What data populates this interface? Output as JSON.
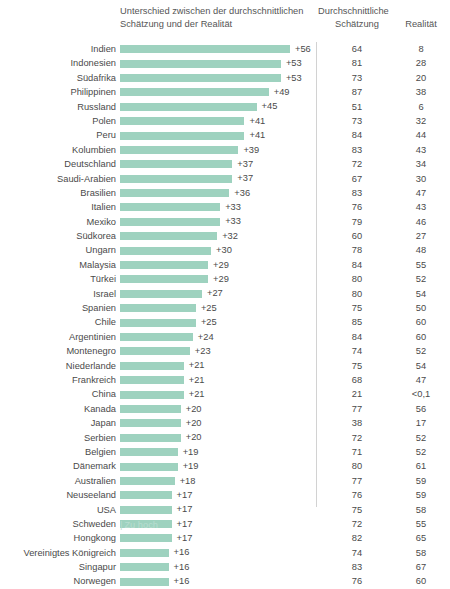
{
  "header": {
    "diff_title_line1": "Unterschied zwischen der durchschnittlichen",
    "diff_title_line2": "Schätzung und der Realität",
    "est_title_line1": "Durchschnittliche",
    "est_title_line2": "Schätzung",
    "real_title": "Realität"
  },
  "legend": {
    "tick": "|",
    "label": "Zu hoch"
  },
  "colors": {
    "bar": "#9ed2bf",
    "legend_text": "#b8ddd0",
    "divider": "#d2d2d2",
    "text": "#4a4a4a"
  },
  "chart_data": {
    "type": "bar",
    "title": "Unterschied zwischen der durchschnittlichen Schätzung und der Realität",
    "xlabel": "",
    "ylabel": "",
    "grid": false,
    "legend_position": "bottom-left",
    "xlim": [
      0,
      56
    ],
    "categories": [
      "Indien",
      "Indonesien",
      "Südafrika",
      "Philippinen",
      "Russland",
      "Polen",
      "Peru",
      "Kolumbien",
      "Deutschland",
      "Saudi-Arabien",
      "Brasilien",
      "Italien",
      "Mexiko",
      "Südkorea",
      "Ungarn",
      "Malaysia",
      "Türkei",
      "Israel",
      "Spanien",
      "Chile",
      "Argentinien",
      "Montenegro",
      "Niederlande",
      "Frankreich",
      "China",
      "Kanada",
      "Japan",
      "Serbien",
      "Belgien",
      "Dänemark",
      "Australien",
      "Neuseeland",
      "USA",
      "Schweden",
      "Hongkong",
      "Vereinigtes Königreich",
      "Singapur",
      "Norwegen"
    ],
    "values": [
      56,
      53,
      53,
      49,
      45,
      41,
      41,
      39,
      37,
      37,
      36,
      33,
      33,
      32,
      30,
      29,
      29,
      27,
      25,
      25,
      24,
      23,
      21,
      21,
      21,
      20,
      20,
      20,
      19,
      19,
      18,
      17,
      17,
      17,
      17,
      16,
      16,
      16
    ],
    "value_labels": [
      "+56",
      "+53",
      "+53",
      "+49",
      "+45",
      "+41",
      "+41",
      "+39",
      "+37",
      "+37",
      "+36",
      "+33",
      "+33",
      "+32",
      "+30",
      "+29",
      "+29",
      "+27",
      "+25",
      "+25",
      "+24",
      "+23",
      "+21",
      "+21",
      "+21",
      "+20",
      "+20",
      "+20",
      "+19",
      "+19",
      "+18",
      "+17",
      "+17",
      "+17",
      "+17",
      "+16",
      "+16",
      "+16"
    ],
    "series": [
      {
        "name": "Durchschnittliche Schätzung",
        "values": [
          64,
          81,
          73,
          87,
          51,
          73,
          84,
          83,
          72,
          67,
          83,
          76,
          79,
          60,
          78,
          84,
          80,
          80,
          75,
          85,
          84,
          74,
          75,
          68,
          21,
          77,
          38,
          72,
          71,
          80,
          77,
          76,
          75,
          72,
          82,
          74,
          83,
          76
        ],
        "display": [
          "64",
          "81",
          "73",
          "87",
          "51",
          "73",
          "84",
          "83",
          "72",
          "67",
          "83",
          "76",
          "79",
          "60",
          "78",
          "84",
          "80",
          "80",
          "75",
          "85",
          "84",
          "74",
          "75",
          "68",
          "21",
          "77",
          "38",
          "72",
          "71",
          "80",
          "77",
          "76",
          "75",
          "72",
          "82",
          "74",
          "83",
          "76"
        ]
      },
      {
        "name": "Realität",
        "values": [
          8,
          28,
          20,
          38,
          6,
          32,
          44,
          43,
          34,
          30,
          47,
          43,
          46,
          27,
          48,
          55,
          52,
          54,
          50,
          60,
          60,
          52,
          54,
          47,
          0.1,
          56,
          17,
          52,
          52,
          61,
          59,
          59,
          58,
          55,
          65,
          58,
          67,
          60
        ],
        "display": [
          "8",
          "28",
          "20",
          "38",
          "6",
          "32",
          "44",
          "43",
          "34",
          "30",
          "47",
          "43",
          "46",
          "27",
          "48",
          "55",
          "52",
          "54",
          "50",
          "60",
          "60",
          "52",
          "54",
          "47",
          "<0,1",
          "56",
          "17",
          "52",
          "52",
          "61",
          "59",
          "59",
          "58",
          "55",
          "65",
          "58",
          "67",
          "60"
        ]
      }
    ]
  }
}
